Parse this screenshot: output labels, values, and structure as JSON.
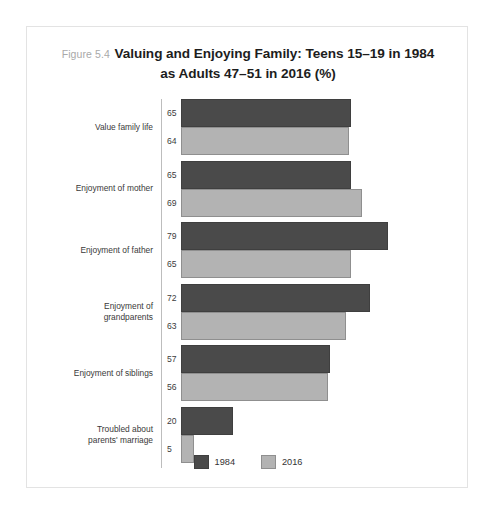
{
  "figure": {
    "number_label": "Figure 5.4",
    "title_line1": "Valuing and Enjoying Family: Teens 15–19 in 1984",
    "title_line2": "as Adults 47–51 in 2016 (%)"
  },
  "colors": {
    "series_1984": "#4a4a4a",
    "series_2016": "#b3b3b3",
    "axis": "#bdbdbd",
    "frame": "#e3e3e3",
    "title_text": "#1d1d1d",
    "figure_number_text": "#a9a9a9"
  },
  "legend": {
    "items": [
      {
        "label": "1984",
        "color": "#4a4a4a"
      },
      {
        "label": "2016",
        "color": "#b3b3b3"
      }
    ]
  },
  "chart_data": {
    "type": "bar",
    "orientation": "horizontal",
    "title": "Figure 5.4 Valuing and Enjoying Family: Teens 15–19 in 1984 as Adults 47–51 in 2016 (%)",
    "xlabel": "",
    "ylabel": "",
    "xlim": [
      0,
      82
    ],
    "grid": false,
    "legend_position": "bottom-center",
    "data_labels": true,
    "categories": [
      "Value family life",
      "Enjoyment of mother",
      "Enjoyment of father",
      "Enjoyment of grandparents",
      "Enjoyment of siblings",
      "Troubled about parents' marriage"
    ],
    "category_lines": [
      [
        "Value family life"
      ],
      [
        "Enjoyment of mother"
      ],
      [
        "Enjoyment of father"
      ],
      [
        "Enjoyment of",
        "grandparents"
      ],
      [
        "Enjoyment of siblings"
      ],
      [
        "Troubled about",
        "parents' marriage"
      ]
    ],
    "series": [
      {
        "name": "1984",
        "color": "#4a4a4a",
        "values": [
          65,
          65,
          79,
          72,
          57,
          20
        ]
      },
      {
        "name": "2016",
        "color": "#b3b3b3",
        "values": [
          64,
          69,
          65,
          63,
          56,
          5
        ]
      }
    ]
  }
}
